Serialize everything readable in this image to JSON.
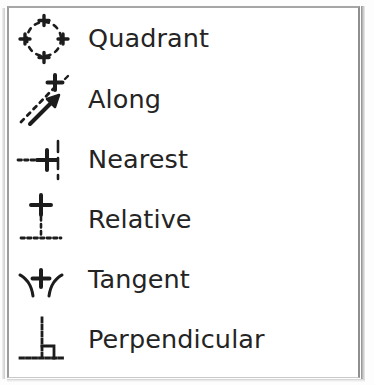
{
  "menu": {
    "name": "snap-mode-menu",
    "background_color": "#ffffff",
    "border_color": "#9c9c9c",
    "text_color": "#242424",
    "icon_color": "#1c1c1c",
    "items": [
      {
        "label": "Quadrant",
        "icon": "quadrant-icon",
        "icon_description": "dashed circle with plus marks at four quadrant points"
      },
      {
        "label": "Along",
        "icon": "along-icon",
        "icon_description": "dashed diagonal line with arrow and plus mark at tip"
      },
      {
        "label": "Nearest",
        "icon": "nearest-icon",
        "icon_description": "horizontal dashed line meeting a plus on a dashed vertical line"
      },
      {
        "label": "Relative",
        "icon": "relative-icon",
        "icon_description": "plus above a dashed vertical line on a dashed baseline"
      },
      {
        "label": "Tangent",
        "icon": "tangent-icon",
        "icon_description": "plus between two curved arcs meeting at a tangent point"
      },
      {
        "label": "Perpendicular",
        "icon": "perpendicular-icon",
        "icon_description": "dashed vertical line meeting dashed baseline with right-angle square"
      }
    ]
  }
}
